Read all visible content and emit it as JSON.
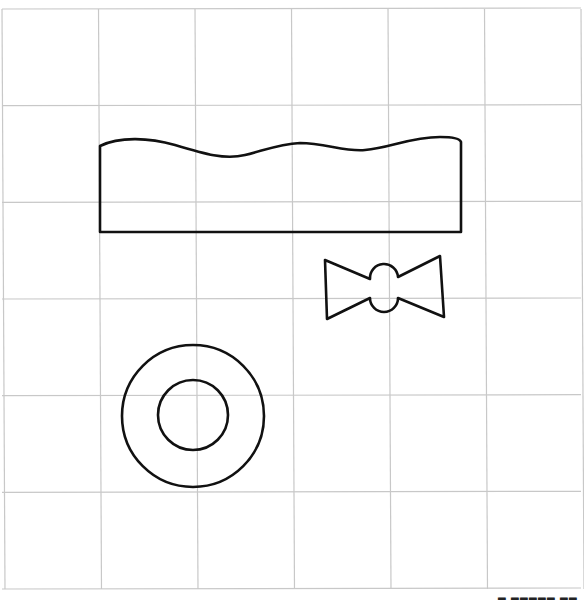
{
  "figure": {
    "grid": {
      "columns": 6,
      "rows": 6
    },
    "shapes": [
      {
        "id": "wavy-top-rectangle",
        "label": "Rectangle with wavy top edge"
      },
      {
        "id": "bow-tie",
        "label": "Bow tie shape"
      },
      {
        "id": "ring",
        "label": "Ring (two concentric circles)"
      }
    ],
    "footer_mark": "▂ ▂▂▂▂▂ ▂▂"
  }
}
